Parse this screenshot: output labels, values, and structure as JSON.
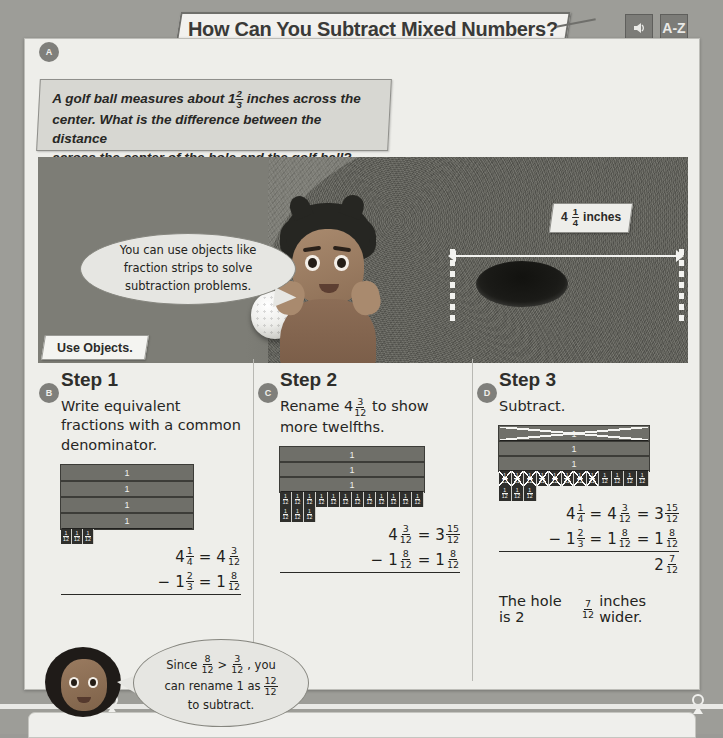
{
  "header": {
    "title": "How Can You Subtract Mixed Numbers?",
    "audio_icon": "audio-speaker-icon",
    "glossary_label": "A-Z",
    "badge_a": "A"
  },
  "problem": {
    "line1": "A golf ball measures about 1",
    "golf_ball_fraction": {
      "num": "2",
      "den": "3"
    },
    "line1_end": " inches across the",
    "line2": "center. What is the difference between the distance",
    "line3": "across the center of the hole and the golf ball?"
  },
  "photo": {
    "measure_whole": "4",
    "measure_fraction": {
      "num": "1",
      "den": "4"
    },
    "measure_unit": "inches",
    "alt": "golf-hole-photo"
  },
  "bubble_top": {
    "line1": "You can use objects like",
    "line2": "fraction strips to solve",
    "line3": "subtraction problems."
  },
  "use_objects_label": "Use Objects.",
  "steps": [
    {
      "badge": "B",
      "title": "Step 1",
      "desc": "Write equivalent fractions with a common denominator.",
      "strips": {
        "wholes": 4,
        "twelfths": 3,
        "twelfths_crossed": 0,
        "extra_twelfths": 0,
        "whole_crossed": 0
      },
      "equations": [
        {
          "op": "",
          "left_whole": "4",
          "left_frac": {
            "num": "1",
            "den": "4"
          },
          "eq": "=",
          "right_whole": "4",
          "right_frac": {
            "num": "3",
            "den": "12"
          }
        },
        {
          "op": "−",
          "left_whole": "1",
          "left_frac": {
            "num": "2",
            "den": "3"
          },
          "eq": "=",
          "right_whole": "1",
          "right_frac": {
            "num": "8",
            "den": "12"
          }
        }
      ]
    },
    {
      "badge": "C",
      "title": "Step 2",
      "desc_pre": "Rename 4",
      "desc_frac": {
        "num": "3",
        "den": "12"
      },
      "desc_post": " to show more twelfths.",
      "strips": {
        "wholes": 3,
        "twelfths": 12,
        "twelfths_crossed": 0,
        "extra_twelfths": 3,
        "whole_crossed": 0
      },
      "equations": [
        {
          "op": "",
          "left_whole": "4",
          "left_frac": {
            "num": "3",
            "den": "12"
          },
          "eq": "=",
          "right_whole": "3",
          "right_frac": {
            "num": "15",
            "den": "12"
          }
        },
        {
          "op": "−",
          "left_whole": "1",
          "left_frac": {
            "num": "8",
            "den": "12"
          },
          "eq": "=",
          "right_whole": "1",
          "right_frac": {
            "num": "8",
            "den": "12"
          }
        }
      ]
    },
    {
      "badge": "D",
      "title": "Step 3",
      "desc": "Subtract.",
      "strips": {
        "wholes": 3,
        "twelfths": 12,
        "twelfths_crossed": 8,
        "extra_twelfths": 3,
        "whole_crossed": 1
      },
      "equations": [
        {
          "op": "",
          "left_whole": "4",
          "left_frac": {
            "num": "1",
            "den": "4"
          },
          "eq": "=",
          "mid_whole": "4",
          "mid_frac": {
            "num": "3",
            "den": "12"
          },
          "eq2": "=",
          "right_whole": "3",
          "right_frac": {
            "num": "15",
            "den": "12"
          }
        },
        {
          "op": "−",
          "left_whole": "1",
          "left_frac": {
            "num": "2",
            "den": "3"
          },
          "eq": "=",
          "mid_whole": "1",
          "mid_frac": {
            "num": "8",
            "den": "12"
          },
          "eq2": "=",
          "right_whole": "1",
          "right_frac": {
            "num": "8",
            "den": "12"
          }
        }
      ],
      "result_whole": "2",
      "result_frac": {
        "num": "7",
        "den": "12"
      },
      "answer_pre": "The hole is 2",
      "answer_frac": {
        "num": "7",
        "den": "12"
      },
      "answer_post": " inches wider."
    }
  ],
  "bubble_bottom": {
    "l1_pre": "Since",
    "l1_frac_a": {
      "num": "8",
      "den": "12"
    },
    "l1_gt": ">",
    "l1_frac_b": {
      "num": "3",
      "den": "12"
    },
    "l1_post": ", you",
    "l2_pre": "can rename 1 as",
    "l2_frac": {
      "num": "12",
      "den": "12"
    },
    "l3": "to subtract."
  },
  "strip_label": {
    "num": "1",
    "den": "12"
  },
  "whole_label": "1",
  "colors": {
    "page_background": "#9d9d98",
    "card_background": "#eeeeea",
    "strip_whole": "#6f6f69",
    "strip_twelfth": "#2f2f2c",
    "text": "#232320"
  }
}
